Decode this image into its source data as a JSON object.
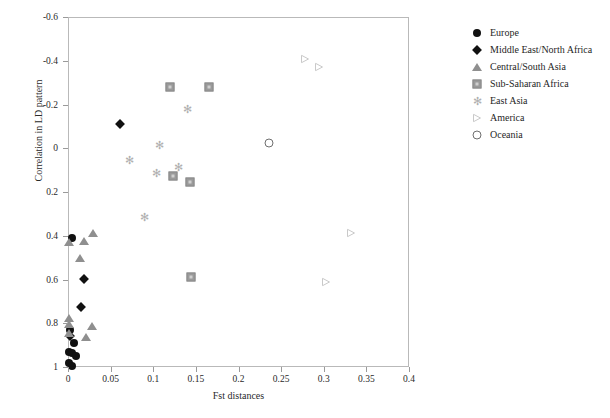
{
  "chart_data": {
    "type": "scatter",
    "title": "",
    "xlabel": "Fst distances",
    "ylabel": "Correlation in LD pattern",
    "xlim": [
      0,
      0.4
    ],
    "ylim": [
      -0.6,
      1.0
    ],
    "y_axis_inverted": true,
    "grid": false,
    "legend_position": "right",
    "xticks": [
      "0",
      "0.05",
      "0.1",
      "0.15",
      "0.2",
      "0.25",
      "0.3",
      "0.35",
      "0.4"
    ],
    "xtick_values": [
      0,
      0.05,
      0.1,
      0.15,
      0.2,
      0.25,
      0.3,
      0.35,
      0.4
    ],
    "yticks": [
      "-0.6",
      "-0.4",
      "-0.2",
      "0",
      "0.2",
      "0.4",
      "0.6",
      "0.8",
      "1"
    ],
    "ytick_values": [
      -0.6,
      -0.4,
      -0.2,
      0,
      0.2,
      0.4,
      0.6,
      0.8,
      1
    ],
    "series": [
      {
        "name": "Europe",
        "marker": "filled-circle",
        "color": "#111111",
        "points": [
          {
            "x": 0.0035,
            "y": 0.405
          },
          {
            "x": 0.001,
            "y": 0.825
          },
          {
            "x": 0.0055,
            "y": 0.885
          },
          {
            "x": 0.0,
            "y": 0.925
          },
          {
            "x": 0.003,
            "y": 0.93
          },
          {
            "x": 0.0085,
            "y": 0.945
          },
          {
            "x": 0.0,
            "y": 0.975
          },
          {
            "x": 0.003,
            "y": 0.99
          }
        ]
      },
      {
        "name": "Middle East/North Africa",
        "marker": "filled-diamond",
        "color": "#111111",
        "points": [
          {
            "x": 0.06,
            "y": -0.115
          },
          {
            "x": 0.0175,
            "y": 0.595
          },
          {
            "x": 0.014,
            "y": 0.72
          },
          {
            "x": 0.001,
            "y": 0.855
          }
        ]
      },
      {
        "name": "Central/South Asia",
        "marker": "filled-triangle-up",
        "color": "#8f8f8f",
        "points": [
          {
            "x": 0.028,
            "y": 0.385
          },
          {
            "x": 0.0175,
            "y": 0.42
          },
          {
            "x": 0.0,
            "y": 0.425
          },
          {
            "x": 0.013,
            "y": 0.495
          },
          {
            "x": 0.0,
            "y": 0.77
          },
          {
            "x": 0.0,
            "y": 0.8
          },
          {
            "x": 0.0275,
            "y": 0.81
          },
          {
            "x": 0.0,
            "y": 0.84
          },
          {
            "x": 0.02,
            "y": 0.86
          }
        ]
      },
      {
        "name": "Sub-Saharan Africa",
        "marker": "filled-square",
        "color": "#9a9a9a",
        "points": [
          {
            "x": 0.1185,
            "y": -0.285
          },
          {
            "x": 0.164,
            "y": -0.285
          },
          {
            "x": 0.1225,
            "y": 0.12
          },
          {
            "x": 0.1415,
            "y": 0.15
          },
          {
            "x": 0.1435,
            "y": 0.585
          }
        ]
      },
      {
        "name": "East Asia",
        "marker": "star",
        "color": "#b0b0b0",
        "points": [
          {
            "x": 0.1385,
            "y": -0.185
          },
          {
            "x": 0.106,
            "y": -0.02
          },
          {
            "x": 0.0705,
            "y": 0.05
          },
          {
            "x": 0.129,
            "y": 0.08
          },
          {
            "x": 0.1025,
            "y": 0.11
          },
          {
            "x": 0.089,
            "y": 0.31
          }
        ]
      },
      {
        "name": "America",
        "marker": "open-triangle-right",
        "color": "#c9c9c9",
        "points": [
          {
            "x": 0.2765,
            "y": -0.435
          },
          {
            "x": 0.293,
            "y": -0.4
          },
          {
            "x": 0.3305,
            "y": 0.36
          },
          {
            "x": 0.3015,
            "y": 0.585
          }
        ]
      },
      {
        "name": "Oceania",
        "marker": "open-circle",
        "color": "#6f6f6f",
        "points": [
          {
            "x": 0.235,
            "y": -0.03
          }
        ]
      }
    ]
  },
  "legend": {
    "items": [
      {
        "label": "Europe",
        "marker": "filled-circle"
      },
      {
        "label": "Middle East/North Africa",
        "marker": "filled-diamond"
      },
      {
        "label": "Central/South Asia",
        "marker": "filled-triangle-up"
      },
      {
        "label": "Sub-Saharan Africa",
        "marker": "filled-square"
      },
      {
        "label": "East Asia",
        "marker": "star"
      },
      {
        "label": "America",
        "marker": "open-triangle-right"
      },
      {
        "label": "Oceania",
        "marker": "open-circle"
      }
    ]
  }
}
